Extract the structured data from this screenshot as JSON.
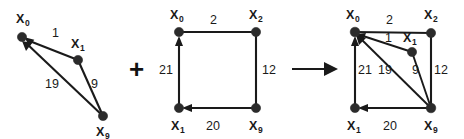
{
  "figure": {
    "background_color": "#ffffff",
    "ink_color": "#1a1a1a",
    "node_color": "#2b2b2b"
  },
  "operators": {
    "plus": "+",
    "arrow": "arrow-right"
  },
  "graphs": [
    {
      "id": "graph-left",
      "name": "triangle-graph",
      "nodes": [
        {
          "id": "x0",
          "base": "X",
          "sub": "0",
          "x": 22,
          "y": 37,
          "label_x": 16,
          "label_y": 23
        },
        {
          "id": "x1",
          "base": "X",
          "sub": "1",
          "x": 78,
          "y": 60,
          "label_x": 71,
          "label_y": 48
        },
        {
          "id": "x9",
          "base": "X",
          "sub": "9",
          "x": 103,
          "y": 116,
          "label_x": 96,
          "label_y": 136
        }
      ],
      "edges": [
        {
          "from": "x1",
          "to": "x0",
          "weight": "1",
          "label_x": 52,
          "label_y": 37,
          "arrow": true
        },
        {
          "from": "x9",
          "to": "x0",
          "weight": "19",
          "label_x": 49,
          "label_y": 88,
          "arrow": true
        },
        {
          "from": "x1",
          "to": "x9",
          "weight": "9",
          "label_x": 91,
          "label_y": 88,
          "arrow": false
        }
      ]
    },
    {
      "id": "graph-middle",
      "name": "square-graph",
      "nodes": [
        {
          "id": "x0",
          "base": "X",
          "sub": "0",
          "x": 179,
          "y": 32,
          "label_x": 170,
          "label_y": 19
        },
        {
          "id": "x2",
          "base": "X",
          "sub": "2",
          "x": 256,
          "y": 32,
          "label_x": 249,
          "label_y": 19
        },
        {
          "id": "x1",
          "base": "X",
          "sub": "1",
          "x": 179,
          "y": 108,
          "label_x": 171,
          "label_y": 130
        },
        {
          "id": "x9",
          "base": "X",
          "sub": "9",
          "x": 256,
          "y": 108,
          "label_x": 249,
          "label_y": 130
        }
      ],
      "edges": [
        {
          "from": "x0",
          "to": "x2",
          "weight": "2",
          "label_x": 213,
          "label_y": 24,
          "arrow": false
        },
        {
          "from": "x2",
          "to": "x9",
          "weight": "12",
          "label_x": 264,
          "label_y": 74,
          "arrow": false
        },
        {
          "from": "x9",
          "to": "x1",
          "weight": "20",
          "label_x": 209,
          "label_y": 130,
          "arrow": true
        },
        {
          "from": "x1",
          "to": "x0",
          "weight": "21",
          "label_x": 162,
          "label_y": 74,
          "arrow": true
        }
      ]
    },
    {
      "id": "graph-right",
      "name": "combined-graph",
      "nodes": [
        {
          "id": "x0",
          "base": "X",
          "sub": "0",
          "x": 355,
          "y": 32,
          "label_x": 346,
          "label_y": 19
        },
        {
          "id": "x2",
          "base": "X",
          "sub": "2",
          "x": 431,
          "y": 33,
          "label_x": 424,
          "label_y": 19
        },
        {
          "id": "x1b",
          "base": "X",
          "sub": "1",
          "x": 412,
          "y": 52,
          "label_x": 405,
          "label_y": 41
        },
        {
          "id": "x1",
          "base": "X",
          "sub": "1",
          "x": 355,
          "y": 108,
          "label_x": 347,
          "label_y": 130
        },
        {
          "id": "x9",
          "base": "X",
          "sub": "9",
          "x": 431,
          "y": 108,
          "label_x": 424,
          "label_y": 130
        }
      ],
      "edges": [
        {
          "from": "x0",
          "to": "x2",
          "weight": "2",
          "label_x": 389,
          "label_y": 24,
          "arrow": false
        },
        {
          "from": "x1b",
          "to": "x0",
          "weight": "1",
          "label_x": 386,
          "label_y": 40,
          "arrow": true
        },
        {
          "from": "x2",
          "to": "x9",
          "weight": "12",
          "label_x": 436,
          "label_y": 74,
          "arrow": false
        },
        {
          "from": "x1b",
          "to": "x9",
          "weight": "9",
          "label_x": 414,
          "label_y": 74,
          "arrow": false
        },
        {
          "from": "x9",
          "to": "x0",
          "weight": "19",
          "label_x": 381,
          "label_y": 74,
          "arrow": true
        },
        {
          "from": "x1",
          "to": "x0",
          "weight": "21",
          "label_x": 359,
          "label_y": 74,
          "arrow": true
        },
        {
          "from": "x9",
          "to": "x1",
          "weight": "20",
          "label_x": 386,
          "label_y": 130,
          "arrow": true
        }
      ]
    }
  ]
}
